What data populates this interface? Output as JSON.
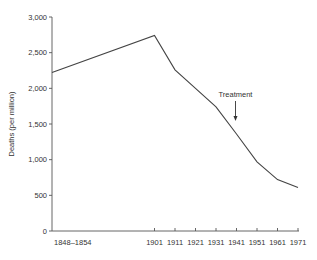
{
  "chart_data": {
    "type": "line",
    "title": "",
    "xlabel": "",
    "ylabel": "Deaths (per million)",
    "ylim": [
      0,
      3000
    ],
    "yticks": [
      0,
      500,
      1000,
      1500,
      2000,
      2500,
      3000
    ],
    "ytick_labels": [
      "0",
      "500",
      "1,000",
      "1,500",
      "2,000",
      "2,500",
      "3,000"
    ],
    "categories": [
      "1848–1854",
      "1901",
      "1911",
      "1921",
      "1931",
      "1941",
      "1951",
      "1961",
      "1971"
    ],
    "values": [
      2220,
      2740,
      2260,
      2000,
      1740,
      1360,
      970,
      720,
      610
    ],
    "grid": false,
    "legend": null,
    "annotations": [
      {
        "text": "Treatment",
        "x": "1941",
        "type": "arrow-down"
      }
    ]
  },
  "labels": {
    "ylabel": "Deaths (per million)",
    "annotation": "Treatment"
  }
}
